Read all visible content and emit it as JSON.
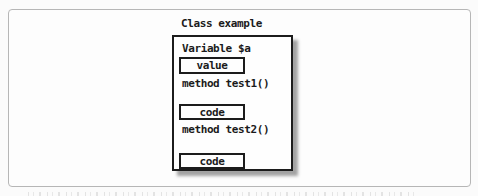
{
  "figure": {
    "title": "Class example",
    "members": [
      {
        "kind": "variable",
        "label": "Variable $a",
        "box_text": "value"
      },
      {
        "kind": "method",
        "label": "method test1()",
        "box_text": "code"
      },
      {
        "kind": "method",
        "label": "method test2()",
        "box_text": "code"
      }
    ]
  },
  "colors": {
    "text": "#1b1b1b",
    "class_box_border": "#1c1c1c",
    "class_box_shadow": "#a3a3a3",
    "frame_border": "#b6b6b6",
    "frame_background": "#fdfdfd"
  }
}
